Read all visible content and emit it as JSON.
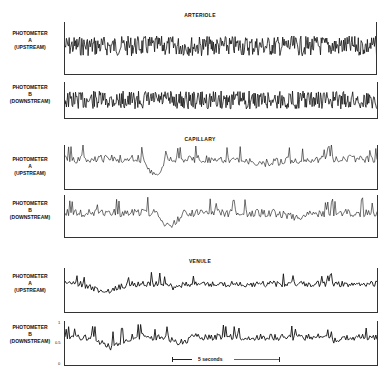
{
  "figure": {
    "sections": [
      {
        "title": "ARTERIOLE",
        "panels": [
          {
            "label_lines": [
              "PHOTOMETER",
              "A",
              "(UPSTREAM)"
            ]
          },
          {
            "label_lines": [
              "PHOTOMETER",
              "B",
              "(DOWNSTREAM)"
            ]
          }
        ]
      },
      {
        "title": "CAPILLARY",
        "panels": [
          {
            "label_lines": [
              "PHOTOMETER",
              "A",
              "(UPSTREAM)"
            ]
          },
          {
            "label_lines": [
              "PHOTOMETER",
              "B",
              "(DOWNSTREAM)"
            ]
          }
        ]
      },
      {
        "title": "VENULE",
        "panels": [
          {
            "label_lines": [
              "PHOTOMETER",
              "A",
              "(UPSTREAM)"
            ]
          },
          {
            "label_lines": [
              "PHOTOMETER",
              "B",
              "(DOWNSTREAM)"
            ]
          }
        ]
      }
    ],
    "scale_bar": {
      "label": "5 seconds"
    },
    "axis_ticks": {
      "top": "1",
      "mid": "0.5",
      "bottom": "0"
    }
  }
}
